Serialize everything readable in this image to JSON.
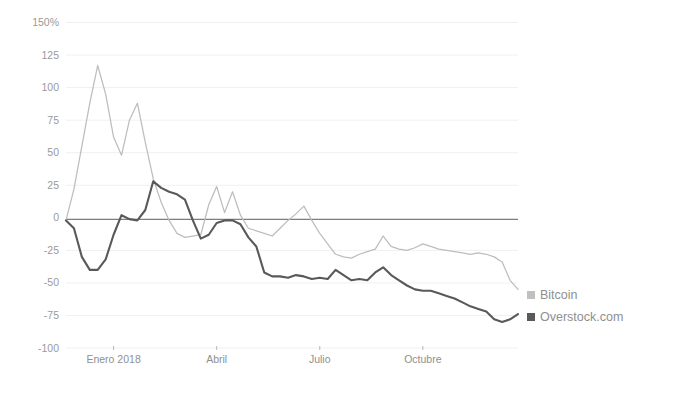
{
  "chart_data": {
    "type": "line",
    "title": "",
    "subtitle": "",
    "xlabel": "",
    "ylabel": "",
    "grid": true,
    "legend_position": "right",
    "ylim": [
      -100,
      150
    ],
    "y_ticks": [
      150,
      125,
      100,
      75,
      50,
      25,
      0,
      -25,
      -50,
      -75,
      -100
    ],
    "y_tick_labels": [
      "150%",
      "125",
      "100",
      "75",
      "50",
      "25",
      "0",
      "-25",
      "-50",
      "-75",
      "-100"
    ],
    "x_tick_labels": [
      "Enero 2018",
      "Abril",
      "Julio",
      "Octubre"
    ],
    "x_tick_positions": [
      6,
      19,
      32,
      45
    ],
    "xlim": [
      0,
      57
    ],
    "series": [
      {
        "name": "Bitcoin",
        "color": "#bdbdbd",
        "legend_swatch": "#c0c0c0",
        "x": [
          0,
          1,
          2,
          3,
          4,
          5,
          6,
          7,
          8,
          9,
          10,
          11,
          12,
          13,
          14,
          15,
          16,
          17,
          18,
          19,
          20,
          21,
          22,
          23,
          24,
          25,
          26,
          27,
          28,
          29,
          30,
          31,
          32,
          33,
          34,
          35,
          36,
          37,
          38,
          39,
          40,
          41,
          42,
          43,
          44,
          45,
          46,
          47,
          48,
          49,
          50,
          51,
          52,
          53,
          54,
          55,
          56,
          57
        ],
        "values": [
          -2,
          22,
          55,
          88,
          117,
          95,
          62,
          48,
          75,
          88,
          58,
          30,
          12,
          -2,
          -12,
          -15,
          -14,
          -13,
          10,
          24,
          4,
          20,
          2,
          -8,
          -10,
          -12,
          -14,
          -8,
          -2,
          3,
          9,
          -2,
          -12,
          -20,
          -28,
          -30,
          -31,
          -28,
          -26,
          -24,
          -14,
          -22,
          -24,
          -25,
          -23,
          -20,
          -22,
          -24,
          -25,
          -26,
          -27,
          -28,
          -27,
          -28,
          -30,
          -34,
          -48,
          -55
        ]
      },
      {
        "name": "Overstock.com",
        "color": "#595959",
        "legend_swatch": "#5a5a5a",
        "x": [
          0,
          1,
          2,
          3,
          4,
          5,
          6,
          7,
          8,
          9,
          10,
          11,
          12,
          13,
          14,
          15,
          16,
          17,
          18,
          19,
          20,
          21,
          22,
          23,
          24,
          25,
          26,
          27,
          28,
          29,
          30,
          31,
          32,
          33,
          34,
          35,
          36,
          37,
          38,
          39,
          40,
          41,
          42,
          43,
          44,
          45,
          46,
          47,
          48,
          49,
          50,
          51,
          52,
          53,
          54,
          55,
          56,
          57
        ],
        "values": [
          -2,
          -8,
          -30,
          -40,
          -40,
          -32,
          -13,
          2,
          -1,
          -2,
          6,
          28,
          23,
          20,
          18,
          14,
          -2,
          -16,
          -13,
          -4,
          -2,
          -2,
          -5,
          -15,
          -22,
          -42,
          -45,
          -45,
          -46,
          -44,
          -45,
          -47,
          -46,
          -47,
          -40,
          -44,
          -48,
          -47,
          -48,
          -42,
          -38,
          -44,
          -48,
          -52,
          -55,
          -56,
          -56,
          -58,
          -60,
          -62,
          -65,
          -68,
          -70,
          -72,
          -78,
          -80,
          -78,
          -74
        ]
      }
    ]
  },
  "legend": {
    "items": [
      {
        "label": "Bitcoin",
        "color": "#c0c0c0"
      },
      {
        "label": "Overstock.com",
        "color": "#5a5a5a"
      }
    ]
  }
}
